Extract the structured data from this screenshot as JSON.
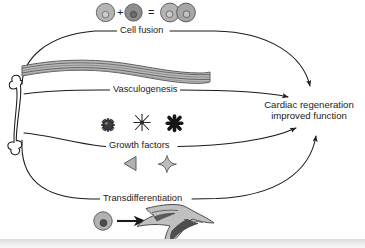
{
  "figure": {
    "title_text": null,
    "background_color": "#ffffff",
    "line_color": "#1b1b1b"
  },
  "source": {
    "icon": "bone-icon",
    "label": ""
  },
  "outcome": {
    "line1": "Cardiac regeneration",
    "line2": "improved function"
  },
  "pathways": [
    {
      "id": "cell-fusion",
      "label": "Cell fusion",
      "icon": "fusing-cells-icon"
    },
    {
      "id": "vasculogenesis",
      "label": "Vasculogenesis",
      "icon": "blood-vessel-icon"
    },
    {
      "id": "growth-factors",
      "label": "Growth factors",
      "icon": "growth-factor-molecules-icon"
    },
    {
      "id": "transdifferentiation",
      "label": "Transdifferentiation",
      "icon": "cell-to-myocyte-icon"
    }
  ],
  "cell_fusion_equation": {
    "plus": "+",
    "equals": "=",
    "cell_a": "light-cell-icon",
    "cell_b": "dark-cell-icon",
    "result": "fused-binucleate-cell-icon"
  },
  "growth_factor_shapes": [
    "spiky-ball-icon",
    "thin-star-icon",
    "thick-asterisk-icon",
    "left-triangle-icon",
    "four-point-star-icon"
  ],
  "transdifferentiation_elements": {
    "source_cell": "round-cell-icon",
    "arrow": "right-arrow-icon",
    "target_cell": "branched-myocyte-icon"
  },
  "colors": {
    "ink": "#1b1b1b",
    "cell_light": "#b0b0b0",
    "cell_dark": "#8a8a8a",
    "vessel_gray": "#9a9a9a",
    "shape_gray": "#a8a8a8",
    "shape_dark": "#2a2a2a"
  }
}
